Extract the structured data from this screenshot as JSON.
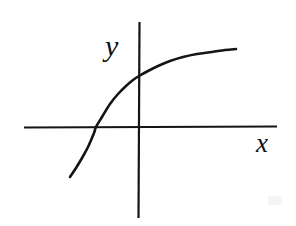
{
  "figure": {
    "name": "cartesian-plot-concave-increasing-curve",
    "background_color": "#ffffff",
    "ink_color": "#151515",
    "width": 296,
    "height": 226
  },
  "labels": {
    "y_axis": "y",
    "x_axis": "x"
  },
  "chart_data": {
    "type": "line",
    "title": "",
    "xlabel": "x",
    "ylabel": "y",
    "grid": false,
    "legend": false,
    "axes": {
      "x_axis": {
        "orientation": "horizontal",
        "pixel_y": 127,
        "pixel_x_start": 24,
        "pixel_x_end": 277,
        "arrowheads": false,
        "ticks": [],
        "tick_labels": []
      },
      "y_axis": {
        "orientation": "vertical",
        "pixel_x": 139,
        "pixel_y_start": 22,
        "pixel_y_end": 218,
        "arrowheads": false,
        "ticks": [],
        "tick_labels": []
      }
    },
    "series": [
      {
        "name": "curve",
        "shape": "increasing-concave-down",
        "stroke_width": 2.6,
        "color": "#151515",
        "points_pixel": [
          [
            70,
            177
          ],
          [
            76,
            168
          ],
          [
            82,
            158
          ],
          [
            88,
            147
          ],
          [
            94,
            133
          ],
          [
            96,
            127
          ],
          [
            102,
            117
          ],
          [
            110,
            104
          ],
          [
            118,
            94
          ],
          [
            126,
            86
          ],
          [
            133,
            80
          ],
          [
            139,
            76
          ],
          [
            148,
            71
          ],
          [
            158,
            66
          ],
          [
            170,
            61
          ],
          [
            183,
            57
          ],
          [
            197,
            54
          ],
          [
            212,
            52
          ],
          [
            225,
            50
          ],
          [
            236,
            49
          ]
        ],
        "x_intercept_pixel": [
          96,
          127
        ],
        "y_intercept_pixel": [
          139,
          76
        ]
      }
    ]
  }
}
